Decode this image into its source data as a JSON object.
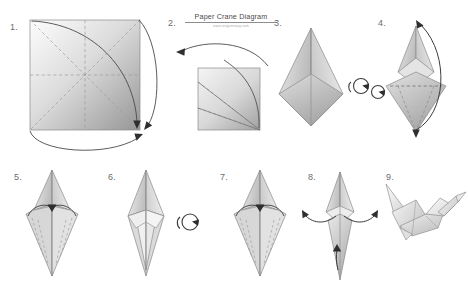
{
  "document": {
    "title": "Paper Crane Diagram",
    "subtitle": "www.origamiway.com",
    "background_color": "#ffffff",
    "line_color": "#58585a",
    "paper_light": "#fcfcfc",
    "paper_mid": "#d4d4d4",
    "paper_dark": "#9a9a9a"
  },
  "steps": [
    {
      "number": "1.",
      "name": "square-with-creases",
      "description": "Flat square sheet with dashed diagonal and midline creases, two curved fold arrows bringing corners together"
    },
    {
      "number": "2.",
      "name": "folded-square",
      "description": "Smaller folded square with dashed fold lines converging at bottom-right corner, curved arrow pointing left"
    },
    {
      "number": "3.",
      "name": "preliminary-base-kite",
      "description": "Tall pointed kite form with side flaps, rotation arrow to the right"
    },
    {
      "number": "4.",
      "name": "petal-fold-diamond",
      "description": "Diamond with dashed horizontal crease and upward curved arrow lifting the flap"
    },
    {
      "number": "5.",
      "name": "bird-base-front",
      "description": "Narrow diamond with curved arrows folding side edges to the center line"
    },
    {
      "number": "6.",
      "name": "bird-base-folded",
      "description": "Narrow diamond with edges folded in, rotation arrow to the right"
    },
    {
      "number": "7.",
      "name": "bird-base-back",
      "description": "Reverse side with curved arrows folding remaining side edges to center"
    },
    {
      "number": "8.",
      "name": "wing-and-neck-folds",
      "description": "Slim form with outward wing arrows and an upward neck arrow"
    },
    {
      "number": "9.",
      "name": "finished-crane",
      "description": "Completed paper crane with head, tail and raised wings"
    }
  ],
  "symbols": {
    "rotate_icon_label": "rotate-over",
    "arrow_label": "fold-arrow"
  }
}
